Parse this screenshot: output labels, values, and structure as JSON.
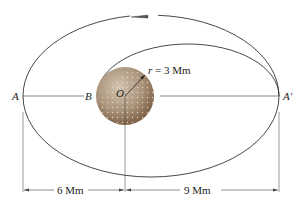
{
  "diagram": {
    "points": {
      "A": "A",
      "B": "B",
      "O": "O",
      "A_prime": "A'"
    },
    "radius_label": "r = 3 Mm",
    "radius_var": "r",
    "radius_value": "= 3 Mm",
    "dimensions": {
      "left": "6 Mm",
      "right": "9 Mm"
    },
    "colors": {
      "line": "#333333",
      "planet_light": "#c7b49c",
      "planet_dark": "#7a5a3e",
      "dots": "#f0d8b0"
    }
  }
}
